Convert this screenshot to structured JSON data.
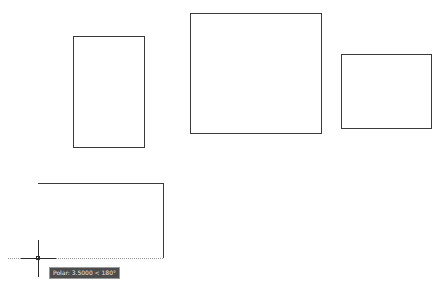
{
  "drawing": {
    "rectangles": [
      {
        "name": "rectangle-1",
        "x": 73,
        "y": 36,
        "w": 72,
        "h": 112
      },
      {
        "name": "rectangle-2",
        "x": 190,
        "y": 13,
        "w": 132,
        "h": 121
      },
      {
        "name": "rectangle-3",
        "x": 341,
        "y": 54,
        "w": 91,
        "h": 75
      }
    ],
    "polyline": {
      "points": [
        [
          38,
          184
        ],
        [
          163,
          184
        ],
        [
          163,
          258
        ]
      ]
    },
    "cursor": {
      "x": 38,
      "y": 258
    },
    "tracking_line": {
      "x1": 8,
      "x2": 163,
      "y": 258
    }
  },
  "tooltip": {
    "label": "Polar: 3.5000 < 180°"
  },
  "colors": {
    "background": "#ffffff",
    "line": "#3a3a3a",
    "tooltip_bg": "#4d4d4d",
    "tooltip_text": "#e8e8e8"
  }
}
